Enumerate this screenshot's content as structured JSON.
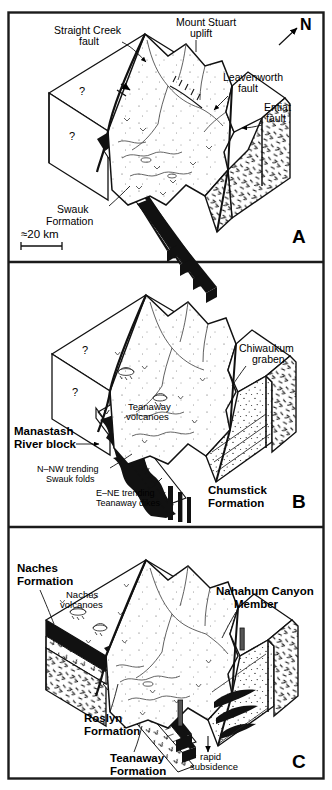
{
  "figure": {
    "name": "three-panel-block-diagram",
    "background": "#ffffff",
    "ink": "#000000",
    "panel_count": 3
  },
  "scale_bar": {
    "label": "≈20 km"
  },
  "north_arrow": {
    "label": "N"
  },
  "panels": [
    {
      "id": "A",
      "letter": "A",
      "labels": [
        {
          "name": "straight-creek-fault",
          "lines": [
            "Straight  Creek",
            "fault"
          ]
        },
        {
          "name": "mount-stuart-uplift",
          "lines": [
            "Mount Stuart",
            "uplift"
          ]
        },
        {
          "name": "leavenworth-fault",
          "lines": [
            "Leavenworth",
            "fault"
          ]
        },
        {
          "name": "entiat-fault",
          "lines": [
            "Entiat",
            "fault"
          ]
        },
        {
          "name": "swauk-formation",
          "lines": [
            "Swauk",
            "Formation"
          ]
        },
        {
          "name": "unknown-query-upper",
          "lines": [
            "?"
          ]
        },
        {
          "name": "unknown-query-lower",
          "lines": [
            "?"
          ]
        }
      ]
    },
    {
      "id": "B",
      "letter": "B",
      "labels": [
        {
          "name": "chiwaukum-graben",
          "lines": [
            "Chiwaukum",
            "graben"
          ]
        },
        {
          "name": "teanaway-volcanoes",
          "lines": [
            "Teanaway",
            "volcanoes"
          ]
        },
        {
          "name": "manastash-river-block",
          "lines": [
            "Manastash",
            "River block"
          ]
        },
        {
          "name": "swauk-folds",
          "lines": [
            "N–NW trending",
            "Swauk folds"
          ]
        },
        {
          "name": "teanaway-dikes",
          "lines": [
            "E–NE trending",
            "Teanaway dikes"
          ]
        },
        {
          "name": "chumstick-formation",
          "lines": [
            "Chumstick",
            "Formation"
          ]
        },
        {
          "name": "unknown-query-upper",
          "lines": [
            "?"
          ]
        },
        {
          "name": "unknown-query-lower",
          "lines": [
            "?"
          ]
        }
      ]
    },
    {
      "id": "C",
      "letter": "C",
      "labels": [
        {
          "name": "naches-formation",
          "lines": [
            "Naches",
            "Formation"
          ]
        },
        {
          "name": "naches-volcanoes",
          "lines": [
            "Naches",
            "volcanoes"
          ]
        },
        {
          "name": "nahahum-canyon-member",
          "lines": [
            "Nahahum Canyon",
            "Member"
          ]
        },
        {
          "name": "roslyn-formation",
          "lines": [
            "Roslyn",
            "Formation"
          ]
        },
        {
          "name": "teanaway-formation",
          "lines": [
            "Teanaway",
            "Formation"
          ]
        },
        {
          "name": "rapid-subsidence",
          "lines": [
            "rapid",
            "subsidence"
          ]
        }
      ]
    }
  ]
}
